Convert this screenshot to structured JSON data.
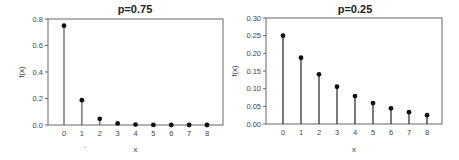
{
  "chart_data": [
    {
      "type": "stem",
      "title": "p=0.75",
      "xlabel": "x",
      "ylabel": "f(x)",
      "x": [
        0,
        1,
        2,
        3,
        4,
        5,
        6,
        7,
        8
      ],
      "values": [
        0.75,
        0.1875,
        0.046875,
        0.01171875,
        0.0029296875,
        0.000732421875,
        0.00018310546875,
        4.57763671875e-05,
        1.1444091796875e-05
      ],
      "xlim": [
        -0.9,
        8.9
      ],
      "ylim": [
        0,
        0.8
      ],
      "yticks": [
        0.0,
        0.2,
        0.4,
        0.6,
        0.8
      ],
      "ytick_labels": [
        "0.0",
        "0.2",
        "0.4",
        "0.6",
        "0.8"
      ],
      "xticks": [
        0,
        1,
        2,
        3,
        4,
        5,
        6,
        7,
        8
      ],
      "xtick_labels": [
        "0",
        "1",
        "2",
        "3",
        "4",
        "5",
        "6",
        "7",
        "8"
      ],
      "grid": false,
      "annotation": "·"
    },
    {
      "type": "stem",
      "title": "p=0.25",
      "xlabel": "x",
      "ylabel": "f(x)",
      "x": [
        0,
        1,
        2,
        3,
        4,
        5,
        6,
        7,
        8
      ],
      "values": [
        0.25,
        0.1875,
        0.140625,
        0.10546875,
        0.0791015625,
        0.059326171875,
        0.04449462890625,
        0.0333709716796875,
        0.025028228759765625
      ],
      "xlim": [
        -0.9,
        8.9
      ],
      "ylim": [
        0,
        0.3
      ],
      "yticks": [
        0.0,
        0.05,
        0.1,
        0.15,
        0.2,
        0.25,
        0.3
      ],
      "ytick_labels": [
        "0.00",
        "0.05",
        "0.10",
        "0.15",
        "0.20",
        "0.25",
        "0.30"
      ],
      "xticks": [
        0,
        1,
        2,
        3,
        4,
        5,
        6,
        7,
        8
      ],
      "xtick_labels": [
        "0",
        "1",
        "2",
        "3",
        "4",
        "5",
        "6",
        "7",
        "8"
      ],
      "grid": false
    }
  ]
}
